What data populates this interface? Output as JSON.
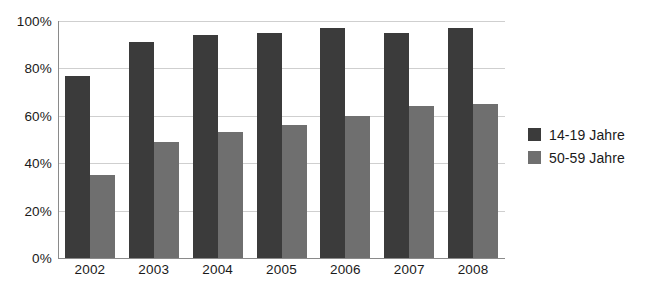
{
  "chart_data": {
    "type": "bar",
    "title": "",
    "subtitle": "",
    "xlabel": "",
    "ylabel": "",
    "categories": [
      "2002",
      "2003",
      "2004",
      "2005",
      "2006",
      "2007",
      "2008"
    ],
    "series": [
      {
        "name": "14-19 Jahre",
        "color": "#3b3b3b",
        "values": [
          77,
          91,
          94,
          95,
          97,
          95,
          97
        ]
      },
      {
        "name": "50-59 Jahre",
        "color": "#6f6f6f",
        "values": [
          35,
          49,
          53,
          56,
          60,
          64,
          65
        ]
      }
    ],
    "ylim": [
      0,
      100
    ],
    "ytick_values": [
      0,
      20,
      40,
      60,
      80,
      100
    ],
    "ytick_labels": [
      "0%",
      "20%",
      "40%",
      "60%",
      "80%",
      "100%"
    ],
    "grid": true,
    "legend_position": "right",
    "value_suffix": "%"
  },
  "axes": {
    "y_axis_name": "percent-axis",
    "x_axis_name": "year-axis"
  }
}
